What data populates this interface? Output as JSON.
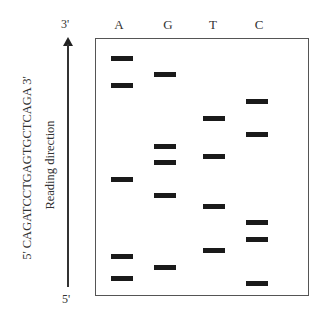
{
  "sequence_label": "5'  CAGATCCTGAGTGCTCAGA  3'",
  "reading_direction": "Reading direction",
  "arrow": {
    "top_label": "3'",
    "bottom_label": "5'"
  },
  "lanes": [
    {
      "label": "A",
      "center_x": 122,
      "bands_y": [
        58,
        85,
        179,
        256,
        278
      ]
    },
    {
      "label": "G",
      "center_x": 165,
      "bands_y": [
        74,
        146,
        162,
        195,
        267
      ]
    },
    {
      "label": "T",
      "center_x": 214,
      "bands_y": [
        118,
        156,
        206,
        250
      ]
    },
    {
      "label": "C",
      "center_x": 257,
      "bands_y": [
        101,
        134,
        222,
        239,
        283
      ]
    }
  ],
  "colors": {
    "band": "#1a1a1a",
    "border": "#555555"
  }
}
